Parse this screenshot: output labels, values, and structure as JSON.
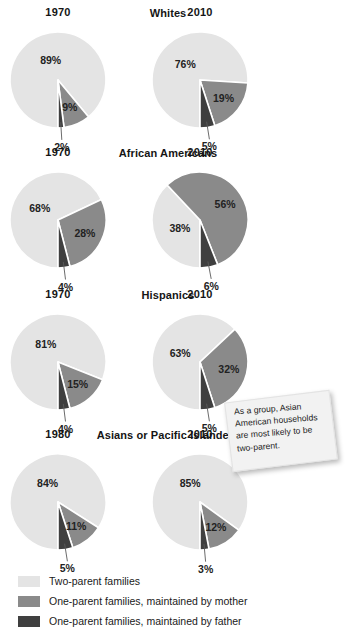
{
  "colors": {
    "two_parent": "#e4e4e4",
    "mother": "#8a8a8a",
    "father": "#3f3f3f",
    "background": "#ffffff",
    "text": "#151515"
  },
  "legend": {
    "items": [
      {
        "label": "Two-parent families",
        "color": "#e4e4e4",
        "key": "two_parent"
      },
      {
        "label": "One-parent families, maintained by mother",
        "color": "#8a8a8a",
        "key": "mother"
      },
      {
        "label": "One-parent families, maintained by father",
        "color": "#3f3f3f",
        "key": "father"
      }
    ]
  },
  "callout": {
    "text": "As a group, Asian American households are most likely to be two-parent."
  },
  "chart_data": {
    "type": "pie",
    "title": "",
    "series_names": [
      "Two-parent families",
      "One-parent families, maintained by mother",
      "One-parent families, maintained by father"
    ],
    "groups": [
      {
        "group": "Whites",
        "charts": [
          {
            "year": "1970",
            "values": [
              89,
              9,
              2
            ],
            "labels": [
              "89%",
              "9%",
              "2%"
            ]
          },
          {
            "year": "2010",
            "values": [
              76,
              19,
              5
            ],
            "labels": [
              "76%",
              "19%",
              "5%"
            ]
          }
        ]
      },
      {
        "group": "African Americans",
        "charts": [
          {
            "year": "1970",
            "values": [
              68,
              28,
              4
            ],
            "labels": [
              "68%",
              "28%",
              "4%"
            ]
          },
          {
            "year": "2010",
            "values": [
              38,
              56,
              6
            ],
            "labels": [
              "38%",
              "56%",
              "6%"
            ]
          }
        ]
      },
      {
        "group": "Hispanics",
        "charts": [
          {
            "year": "1970",
            "values": [
              81,
              15,
              4
            ],
            "labels": [
              "81%",
              "15%",
              "4%"
            ]
          },
          {
            "year": "2010",
            "values": [
              63,
              32,
              5
            ],
            "labels": [
              "63%",
              "32%",
              "5%"
            ]
          }
        ]
      },
      {
        "group": "Asians or Pacific Islanders",
        "charts": [
          {
            "year": "1980",
            "values": [
              84,
              11,
              5
            ],
            "labels": [
              "84%",
              "11%",
              "5%"
            ]
          },
          {
            "year": "2010",
            "values": [
              85,
              12,
              3
            ],
            "labels": [
              "85%",
              "12%",
              "3%"
            ]
          }
        ]
      }
    ]
  }
}
